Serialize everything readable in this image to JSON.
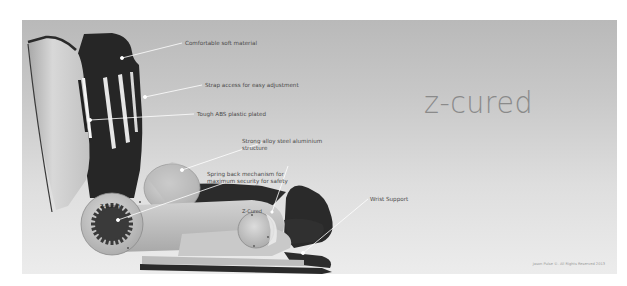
{
  "brand": {
    "title": "z-cured"
  },
  "annotations": [
    {
      "id": "soft-material",
      "label": "Comfortable soft material"
    },
    {
      "id": "strap-access",
      "label": "Strap access for easy adjustment"
    },
    {
      "id": "abs-plastic",
      "label": "Tough ABS plastic plated"
    },
    {
      "id": "alloy-structure",
      "label_line1": "Strong alloy steel aluminium",
      "label_line2": "structure"
    },
    {
      "id": "spring-back",
      "label_line1": "Spring back mechanism for",
      "label_line2": "maximum security for safety"
    },
    {
      "id": "wrist-support",
      "label": "Wrist Support"
    }
  ],
  "device": {
    "hinge_text_1": "Z-Cured",
    "hinge_text_2": "Z-Cured"
  },
  "footer": {
    "copyright": "Jason Pulse ©. All Rights Reserved 2013"
  },
  "colors": {
    "background_top": "#b9b9b9",
    "background_bottom": "#ececec",
    "pad": "#2a2a2a",
    "shell": "#cfcfcf",
    "brand_text": "#8a8a8a"
  }
}
